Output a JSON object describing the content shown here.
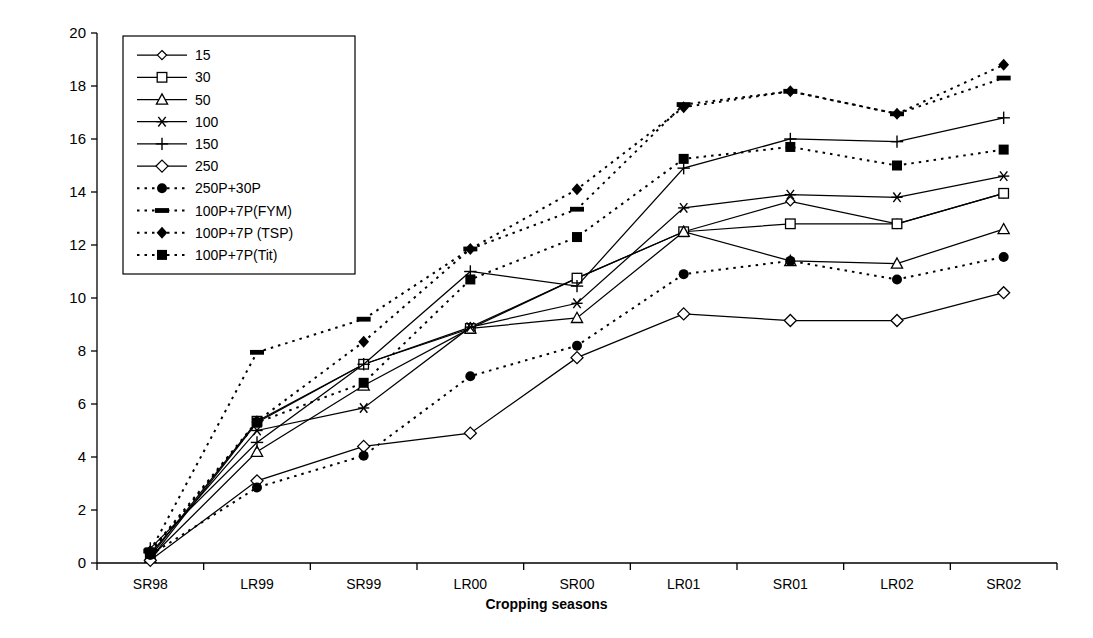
{
  "chart_data": {
    "type": "line",
    "title": "",
    "xlabel": "Cropping seasons",
    "ylabel": "Cummulative phosphorus recovery (%)",
    "categories": [
      "SR98",
      "LR99",
      "SR99",
      "LR00",
      "SR00",
      "LR01",
      "SR01",
      "LR02",
      "SR02"
    ],
    "ylim": [
      0,
      20
    ],
    "yticks": [
      0,
      2,
      4,
      6,
      8,
      10,
      12,
      14,
      16,
      18,
      20
    ],
    "grid": false,
    "legend_position": "top-left-inside",
    "series": [
      {
        "name": "15",
        "marker": "diamond-open-small",
        "style": "solid",
        "values": [
          0.15,
          5.3,
          7.5,
          8.9,
          10.75,
          12.5,
          13.65,
          12.8,
          13.95
        ]
      },
      {
        "name": "30",
        "marker": "square-open",
        "style": "solid",
        "values": [
          0.25,
          5.35,
          7.5,
          8.85,
          10.75,
          12.5,
          12.8,
          12.8,
          13.95
        ]
      },
      {
        "name": "50",
        "marker": "triangle-open",
        "style": "solid",
        "values": [
          0.2,
          4.2,
          6.7,
          8.85,
          9.25,
          12.5,
          11.4,
          11.3,
          12.6
        ]
      },
      {
        "name": "100",
        "marker": "star",
        "style": "solid",
        "values": [
          0.35,
          5.0,
          5.85,
          8.9,
          9.8,
          13.4,
          13.9,
          13.8,
          14.6
        ]
      },
      {
        "name": "150",
        "marker": "plus",
        "style": "solid",
        "values": [
          0.55,
          4.55,
          7.5,
          11.0,
          10.45,
          14.9,
          16.0,
          15.9,
          16.8
        ]
      },
      {
        "name": "250",
        "marker": "diamond-open",
        "style": "solid",
        "values": [
          0.1,
          3.1,
          4.4,
          4.9,
          7.75,
          9.4,
          9.15,
          9.15,
          10.2
        ]
      },
      {
        "name": "250P+30P",
        "marker": "circle-filled",
        "style": "dotted",
        "values": [
          0.3,
          2.85,
          4.05,
          7.05,
          8.2,
          10.9,
          11.4,
          10.7,
          11.55
        ]
      },
      {
        "name": "100P+7P(FYM)",
        "marker": "dash-filled",
        "style": "dotted",
        "values": [
          0.45,
          7.95,
          9.2,
          11.85,
          13.35,
          17.3,
          17.8,
          16.95,
          18.3
        ]
      },
      {
        "name": "100P+7P (TSP)",
        "marker": "diamond-filled",
        "style": "dotted",
        "values": [
          0.45,
          5.35,
          8.35,
          11.85,
          14.1,
          17.2,
          17.8,
          16.95,
          18.8
        ]
      },
      {
        "name": "100P+7P(Tit)",
        "marker": "square-filled",
        "style": "dotted",
        "values": [
          0.4,
          5.3,
          6.8,
          10.7,
          12.3,
          15.25,
          15.7,
          15.0,
          15.6
        ]
      }
    ]
  },
  "legend": {
    "items": [
      {
        "label": "15"
      },
      {
        "label": "30"
      },
      {
        "label": "50"
      },
      {
        "label": "100"
      },
      {
        "label": "150"
      },
      {
        "label": "250"
      },
      {
        "label": "250P+30P"
      },
      {
        "label": "100P+7P(FYM)"
      },
      {
        "label": "100P+7P (TSP)"
      },
      {
        "label": "100P+7P(Tit)"
      }
    ]
  },
  "colors": {
    "line": "#000000",
    "axis": "#000000",
    "background": "#ffffff"
  }
}
